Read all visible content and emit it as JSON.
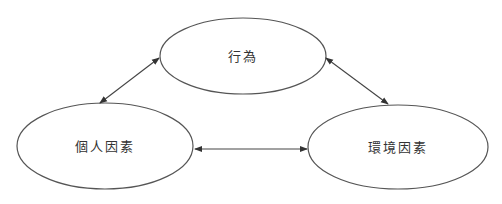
{
  "diagram": {
    "nodes": [
      {
        "id": "behavior",
        "label": "行為",
        "cx": 243,
        "cy": 56,
        "rx": 83,
        "ry": 38
      },
      {
        "id": "personal",
        "label": "個人因素",
        "cx": 105,
        "cy": 146,
        "rx": 88,
        "ry": 43
      },
      {
        "id": "environment",
        "label": "環境因素",
        "cx": 398,
        "cy": 147,
        "rx": 90,
        "ry": 42
      }
    ],
    "edges": [
      {
        "from": "personal",
        "to": "behavior",
        "direction": "bidirectional"
      },
      {
        "from": "behavior",
        "to": "environment",
        "direction": "bidirectional"
      },
      {
        "from": "personal",
        "to": "environment",
        "direction": "bidirectional"
      }
    ],
    "colors": {
      "stroke": "#555555",
      "text": "#333333",
      "background": "#ffffff"
    }
  }
}
